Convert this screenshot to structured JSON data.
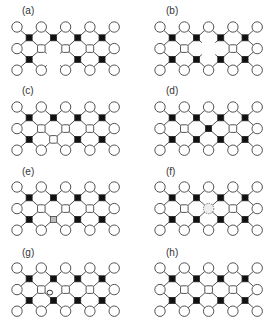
{
  "figure": {
    "colors": {
      "circle_atom": "#ffffff",
      "square_atom": "#111111",
      "bond": "#555555",
      "substitution": "#bbbbbb"
    },
    "panels": [
      {
        "id": "a",
        "label": "(a)",
        "defect": "square-vacancy-bottom",
        "defect_site": {
          "type": "square",
          "row": 1,
          "col": 1
        }
      },
      {
        "id": "b",
        "label": "(b)",
        "defect": "circle-vacancy-middle",
        "defect_site": {
          "type": "circle",
          "row": 1,
          "col": 2
        }
      },
      {
        "id": "c",
        "label": "(c)",
        "defect": "antisite-circle-on-square",
        "defect_site": {
          "type": "square",
          "row": 1,
          "col": 1
        }
      },
      {
        "id": "d",
        "label": "(d)",
        "defect": "antisite-square-on-circle",
        "defect_site": {
          "type": "circle",
          "row": 1,
          "col": 2
        }
      },
      {
        "id": "e",
        "label": "(e)",
        "defect": "substitution-on-square",
        "defect_site": {
          "type": "square",
          "row": 1,
          "col": 1
        }
      },
      {
        "id": "f",
        "label": "(f)",
        "defect": "substitution-on-circle",
        "defect_site": {
          "type": "circle",
          "row": 1,
          "col": 2
        }
      },
      {
        "id": "g",
        "label": "(g)",
        "defect": "interstitial",
        "defect_site": {
          "type": "interstitial",
          "row": 1,
          "col": 1
        }
      },
      {
        "id": "h",
        "label": "(h)",
        "defect": "none",
        "defect_site": null
      }
    ],
    "interstitial_label": "o"
  }
}
